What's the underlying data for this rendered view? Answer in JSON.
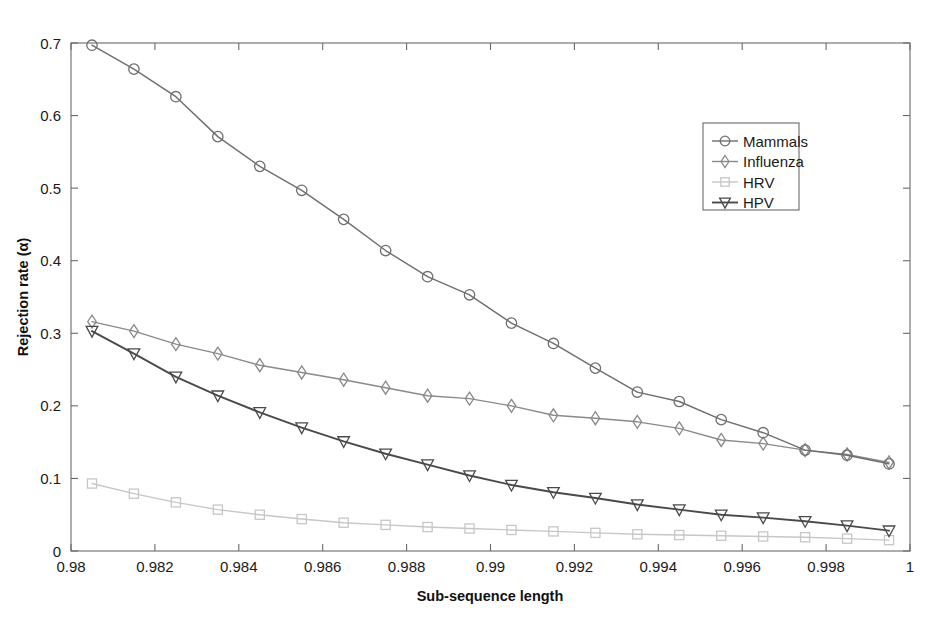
{
  "chart_data": {
    "type": "line",
    "title": "",
    "xlabel": "Sub-sequence length",
    "ylabel": "Rejection rate (α)",
    "xlim": [
      0.98,
      1.0
    ],
    "ylim": [
      0.0,
      0.7
    ],
    "xticks": [
      0.98,
      0.982,
      0.984,
      0.986,
      0.988,
      0.99,
      0.992,
      0.994,
      0.996,
      0.998,
      1.0
    ],
    "xtick_labels": [
      "0.98",
      "0.982",
      "0.984",
      "0.986",
      "0.988",
      "0.99",
      "0.992",
      "0.994",
      "0.996",
      "0.998",
      "1"
    ],
    "yticks": [
      0,
      0.1,
      0.2,
      0.3,
      0.4,
      0.5,
      0.6,
      0.7
    ],
    "ytick_labels": [
      "0",
      "0.1",
      "0.2",
      "0.3",
      "0.4",
      "0.5",
      "0.6",
      "0.7"
    ],
    "grid": false,
    "legend_position": "upper right",
    "x": [
      0.9805,
      0.9815,
      0.9825,
      0.9835,
      0.9845,
      0.9855,
      0.9865,
      0.9875,
      0.9885,
      0.9895,
      0.9905,
      0.9915,
      0.9925,
      0.9935,
      0.9945,
      0.9955,
      0.9965,
      0.9975,
      0.9985,
      0.9995
    ],
    "series": [
      {
        "name": "Mammals",
        "marker": "circle",
        "color": "#6e6e6e",
        "values": [
          0.697,
          0.664,
          0.626,
          0.571,
          0.53,
          0.497,
          0.457,
          0.414,
          0.378,
          0.353,
          0.314,
          0.286,
          0.252,
          0.219,
          0.206,
          0.181,
          0.163,
          0.139,
          0.132,
          0.12
        ]
      },
      {
        "name": "Influenza",
        "marker": "diamond",
        "color": "#8a8a8a",
        "values": [
          0.316,
          0.303,
          0.285,
          0.272,
          0.256,
          0.246,
          0.236,
          0.225,
          0.214,
          0.21,
          0.2,
          0.187,
          0.183,
          0.178,
          0.169,
          0.153,
          0.148,
          0.139,
          0.133,
          0.122
        ]
      },
      {
        "name": "HRV",
        "marker": "square",
        "color": "#c7c7c7",
        "values": [
          0.093,
          0.079,
          0.067,
          0.057,
          0.05,
          0.044,
          0.039,
          0.036,
          0.033,
          0.031,
          0.029,
          0.027,
          0.025,
          0.023,
          0.022,
          0.021,
          0.02,
          0.019,
          0.017,
          0.015
        ]
      },
      {
        "name": "HPV",
        "marker": "triangle-down",
        "color": "#4a4a4a",
        "values": [
          0.303,
          0.272,
          0.24,
          0.214,
          0.191,
          0.17,
          0.151,
          0.134,
          0.119,
          0.104,
          0.091,
          0.081,
          0.073,
          0.064,
          0.057,
          0.05,
          0.046,
          0.041,
          0.035,
          0.028
        ]
      }
    ]
  },
  "legend": {
    "entries": [
      "Mammals",
      "Influenza",
      "HRV",
      "HPV"
    ]
  },
  "colors": {
    "axis": "#6a6a6a",
    "text": "#1a1a1a",
    "background": "#ffffff"
  }
}
